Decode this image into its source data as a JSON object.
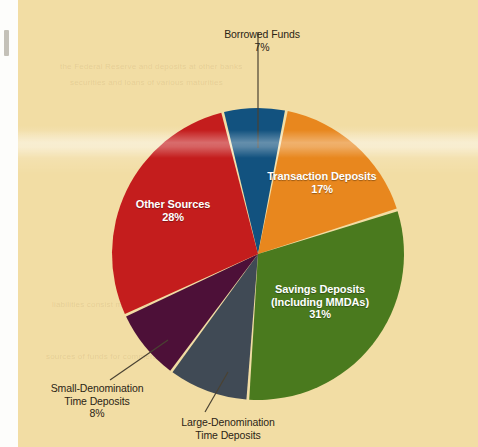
{
  "chart_data": {
    "type": "pie",
    "title": "",
    "subtitle": "",
    "legend_position": "inside-and-callouts",
    "categories": [
      "Borrowed Funds",
      "Transaction Deposits",
      "Savings Deposits (Including MMDAs)",
      "Large-Denomination Time Deposits",
      "Small-Denomination Time Deposits",
      "Other Sources"
    ],
    "values": [
      7,
      17,
      31,
      9,
      8,
      28
    ],
    "value_labels": [
      "7%",
      "17%",
      "31%",
      "",
      "8%",
      "28%"
    ],
    "colors": [
      "#12527f",
      "#e8871e",
      "#4a7a1e",
      "#404a55",
      "#4d1038",
      "#c41d1d"
    ],
    "xlabel": "",
    "ylabel": ""
  },
  "background": {
    "paper_color": "#f2dda4",
    "margin_color": "#fdfdfb"
  },
  "slices": [
    {
      "name": "borrowed-funds",
      "label": "Borrowed Funds",
      "percent": "7%",
      "color": "#12527f",
      "start_deg": -14,
      "end_deg": 11.2,
      "label_placement": "callout-top"
    },
    {
      "name": "transaction-deposits",
      "label": "Transaction Deposits",
      "percent": "17%",
      "color": "#e8871e",
      "start_deg": 11.2,
      "end_deg": 72.4,
      "label_placement": "inside"
    },
    {
      "name": "savings-deposits",
      "label": "Savings Deposits",
      "label_line2": "(Including MMDAs)",
      "percent": "31%",
      "color": "#4a7a1e",
      "start_deg": 72.4,
      "end_deg": 184,
      "label_placement": "inside"
    },
    {
      "name": "large-denomination-time-deposits",
      "label": "Large-Denomination",
      "label_line2": "Time Deposits",
      "percent": "",
      "color": "#404a55",
      "start_deg": 184,
      "end_deg": 216.4,
      "label_placement": "callout-bottom"
    },
    {
      "name": "small-denomination-time-deposits",
      "label": "Small-Denomination",
      "label_line2": "Time Deposits",
      "percent": "8%",
      "color": "#4d1038",
      "start_deg": 216.4,
      "end_deg": 245.2,
      "label_placement": "callout-left"
    },
    {
      "name": "other-sources",
      "label": "Other Sources",
      "percent": "28%",
      "color": "#c41d1d",
      "start_deg": 245.2,
      "end_deg": 346,
      "label_placement": "inside"
    }
  ],
  "ghost_text": [
    "the Federal Reserve and deposits at other banks",
    "securities and loans of various maturities",
    "liabilities consist mainly of deposits",
    "sources of funds for commercial banks"
  ]
}
